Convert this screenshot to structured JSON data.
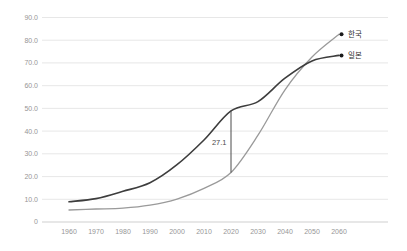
{
  "chart_data": {
    "type": "line",
    "title": "",
    "xlabel": "",
    "ylabel": "",
    "xlim": [
      1960,
      2060
    ],
    "ylim": [
      0,
      90
    ],
    "grid": "horizontal",
    "legend_position": "line-end-labels-right",
    "x": [
      1960,
      1970,
      1980,
      1990,
      2000,
      2010,
      2020,
      2030,
      2040,
      2050,
      2060
    ],
    "x_ticks": [
      {
        "value": 1960,
        "label": "1960"
      },
      {
        "value": 1970,
        "label": "1970"
      },
      {
        "value": 1980,
        "label": "1980"
      },
      {
        "value": 1990,
        "label": "1990"
      },
      {
        "value": 2000,
        "label": "2000"
      },
      {
        "value": 2010,
        "label": "2010"
      },
      {
        "value": 2020,
        "label": "2020"
      },
      {
        "value": 2030,
        "label": "2030"
      },
      {
        "value": 2040,
        "label": "2040"
      },
      {
        "value": 2050,
        "label": "2050"
      },
      {
        "value": 2060,
        "label": "2060"
      }
    ],
    "y_ticks": [
      {
        "value": 0,
        "label": "0"
      },
      {
        "value": 10,
        "label": "10.0"
      },
      {
        "value": 20,
        "label": "20.0"
      },
      {
        "value": 30,
        "label": "30.0"
      },
      {
        "value": 40,
        "label": "40.0"
      },
      {
        "value": 50,
        "label": "50.0"
      },
      {
        "value": 60,
        "label": "60.0"
      },
      {
        "value": 70,
        "label": "70.0"
      },
      {
        "value": 80,
        "label": "80.0"
      },
      {
        "value": 90,
        "label": "90.0"
      }
    ],
    "series": [
      {
        "name": "한국",
        "color": "#9a9a9a",
        "line_width": 1.3,
        "marker_color": "#1a1a1a",
        "values": [
          5.3,
          5.7,
          6.1,
          7.4,
          10.1,
          14.8,
          21.8,
          38.2,
          58.2,
          72.6,
          82.6
        ]
      },
      {
        "name": "일본",
        "color": "#3d3d3d",
        "line_width": 1.6,
        "marker_color": "#1a1a1a",
        "values": [
          8.9,
          10.3,
          13.5,
          17.3,
          25.2,
          36.1,
          48.9,
          53.0,
          63.3,
          70.9,
          73.3
        ]
      }
    ],
    "annotation": {
      "label": "27.1",
      "x": 2020,
      "y_top": 48.9,
      "y_bottom": 21.8
    }
  },
  "style": {
    "background": "#ffffff",
    "grid_color": "#e4e4e4",
    "baseline_color": "#c9c9c9",
    "tick_label_color": "#969696",
    "annotation_color": "#4a4a4a",
    "series_label_color": "#2f2f2f"
  }
}
